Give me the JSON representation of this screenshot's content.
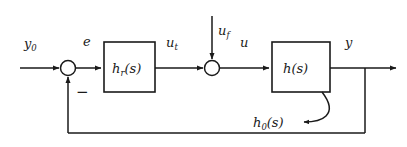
{
  "diagram": {
    "type": "control-block-diagram",
    "background_color": "#ffffff",
    "line_color": "#1a1a1a",
    "blocks": [
      {
        "id": "controller",
        "label": "h",
        "subscript": "r",
        "suffix": "(s)",
        "full_label": "h_r(s)"
      },
      {
        "id": "plant",
        "label": "h",
        "subscript": "",
        "suffix": "(s)",
        "full_label": "h(s)"
      }
    ],
    "junctions": [
      {
        "id": "error-junction",
        "name": "summing-junction-error"
      },
      {
        "id": "feedforward-junction",
        "name": "summing-junction-input"
      }
    ],
    "signals": {
      "reference": {
        "label": "y",
        "subscript": "0"
      },
      "error": {
        "label": "e",
        "subscript": ""
      },
      "controller_output": {
        "label": "u",
        "subscript": "t"
      },
      "feedforward": {
        "label": "u",
        "subscript": "f"
      },
      "plant_input": {
        "label": "u",
        "subscript": ""
      },
      "output": {
        "label": "y",
        "subscript": ""
      }
    },
    "annotations": {
      "feedback_sign": "−",
      "feedback_transfer": {
        "label": "h",
        "subscript": "0",
        "suffix": "(s)",
        "full_label": "h_0(s)"
      }
    }
  }
}
